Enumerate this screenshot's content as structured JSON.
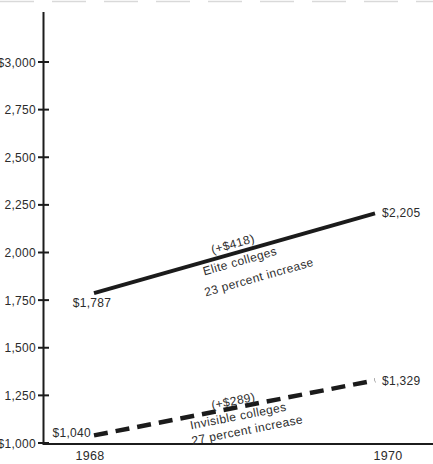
{
  "chart_data": {
    "type": "line",
    "title": "",
    "xlabel": "",
    "ylabel": "",
    "x": [
      1968,
      1970
    ],
    "xtick_labels": [
      "1968",
      "1970"
    ],
    "ylim": [
      1000,
      3000
    ],
    "grid": false,
    "legend": "inline-annotations",
    "yticks": [
      {
        "value": 3000,
        "label": "$3,000"
      },
      {
        "value": 2750,
        "label": "2,750"
      },
      {
        "value": 2500,
        "label": "2,500"
      },
      {
        "value": 2250,
        "label": "2,250"
      },
      {
        "value": 2000,
        "label": "2,000"
      },
      {
        "value": 1750,
        "label": "1,750"
      },
      {
        "value": 1500,
        "label": "1,500"
      },
      {
        "value": 1250,
        "label": "1,250"
      },
      {
        "value": 1000,
        "label": "$1,000"
      }
    ],
    "series": [
      {
        "name": "Elite colleges",
        "style": "solid",
        "values": [
          1787,
          2205
        ],
        "start_label": "$1,787",
        "end_label": "$2,205",
        "annotation": [
          "(+$418)",
          "Elite colleges",
          "23 percent increase"
        ]
      },
      {
        "name": "Invisible colleges",
        "style": "dashed",
        "values": [
          1040,
          1329
        ],
        "start_label": "$1,040",
        "end_label": "$1,329",
        "annotation": [
          "(+$289)",
          "Invisible colleges",
          "27 percent increase"
        ]
      }
    ],
    "colors": {
      "line": "#1b1b1b",
      "text": "#2b2b2b",
      "background": "#ffffff"
    }
  }
}
